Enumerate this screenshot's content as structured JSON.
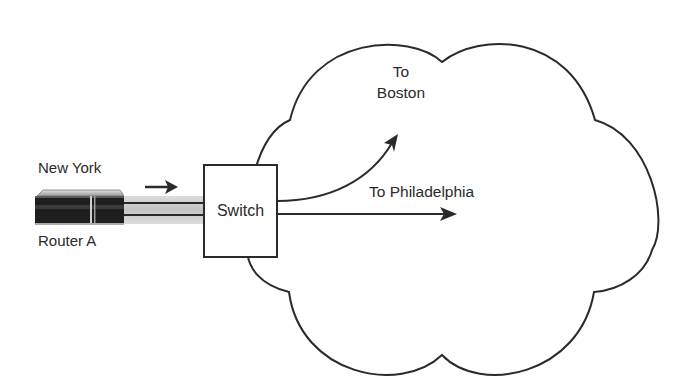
{
  "diagram": {
    "title": "",
    "nodes": {
      "router": {
        "site_label": "New York",
        "name_label": "Router A",
        "icon": "router-icon"
      },
      "switch": {
        "label": "Switch",
        "icon": "switch-box"
      },
      "cloud": {
        "icon": "network-cloud"
      }
    },
    "edges": {
      "router_to_switch": {
        "direction_icon": "arrow-right-icon"
      },
      "to_boston": {
        "label_line1": "To",
        "label_line2": "Boston"
      },
      "to_philadelphia": {
        "label": "To Philadelphia"
      }
    },
    "colors": {
      "stroke": "#2a2a2a",
      "background": "#ffffff",
      "link_fill": "#cfcfcf",
      "router_body": "#1e1e1e",
      "router_top": "#b8b8b8"
    }
  }
}
